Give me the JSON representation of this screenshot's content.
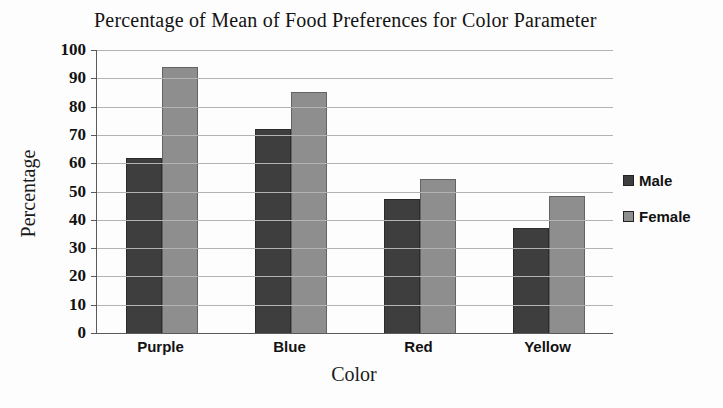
{
  "chart_data": {
    "type": "bar",
    "title": "Percentage of Mean of Food Preferences for Color Parameter",
    "xlabel": "Color",
    "ylabel": "Percentage",
    "categories": [
      "Purple",
      "Blue",
      "Red",
      "Yellow"
    ],
    "series": [
      {
        "name": "Male",
        "color": "#3e3e3e",
        "values": [
          62,
          72,
          47.5,
          37
        ]
      },
      {
        "name": "Female",
        "color": "#8e8e8e",
        "values": [
          94,
          85,
          54.5,
          48.5
        ]
      }
    ],
    "ylim": [
      0,
      100
    ],
    "yticks": [
      0,
      10,
      20,
      30,
      40,
      50,
      60,
      70,
      80,
      90,
      100
    ],
    "grid": true,
    "legend_position": "right"
  },
  "colors": {
    "background": "#fdfdfd",
    "gridline": "#b3b3b3",
    "axis": "#5a5a5a",
    "text": "#151515"
  }
}
